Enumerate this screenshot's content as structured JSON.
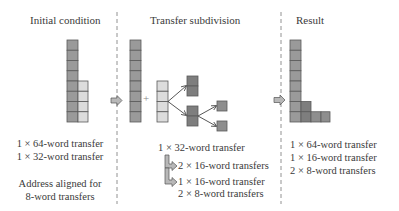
{
  "panels": {
    "initial": {
      "title": "Initial condition",
      "captions": [
        "1 × 64-word transfer",
        "1 × 32-word transfer"
      ],
      "note": [
        "Address aligned for",
        "8-word transfers"
      ]
    },
    "subdivision": {
      "title": "Transfer subdivision",
      "captions": [
        "1 × 32-word transfer",
        "2 × 16-word transfers",
        "1 × 16-word transfer",
        "2 × 8-word transfers"
      ],
      "plus": "+"
    },
    "result": {
      "title": "Result",
      "captions": [
        "1 × 64-word transfer",
        "1 × 16-word transfer",
        "2 × 8-word transfers"
      ]
    }
  },
  "colors": {
    "dark_cell": "#8a8a8a",
    "mid_cell": "#a6a6a6",
    "light_cell": "#dcdcdc",
    "border": "#5a5a5a",
    "arrow_fill": "#b0b0b0",
    "divider": "#777777"
  }
}
